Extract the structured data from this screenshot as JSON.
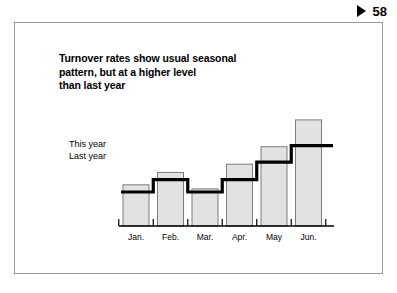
{
  "page_marker": {
    "icon": "play-triangle-icon",
    "number": "58"
  },
  "slide": {
    "title": "Turnover rates show usual seasonal\npattern, but at a higher level\nthan last year"
  },
  "series_labels": {
    "this_year": "This year",
    "last_year": "Last year"
  },
  "colors": {
    "bar_fill": "#e2e2e2",
    "bar_stroke": "#7d7d7d",
    "line": "#000000",
    "axis": "#000000",
    "frame": "#9a9a9a",
    "text": "#000000"
  },
  "chart_data": {
    "type": "bar",
    "title": "Turnover rates show usual seasonal pattern, but at a higher level than last year",
    "xlabel": "",
    "ylabel": "",
    "grid": false,
    "legend_position": "inline-left",
    "categories": [
      "Jan.",
      "Feb.",
      "Mar.",
      "Apr.",
      "May",
      "Jun."
    ],
    "series": [
      {
        "name": "This year",
        "render": "bar",
        "values": [
          40,
          52,
          36,
          60,
          77,
          103
        ]
      },
      {
        "name": "Last year",
        "render": "step-line",
        "values": [
          33,
          45,
          33,
          45,
          62,
          78
        ]
      }
    ],
    "ylim": [
      0,
      115
    ],
    "annotations": []
  }
}
